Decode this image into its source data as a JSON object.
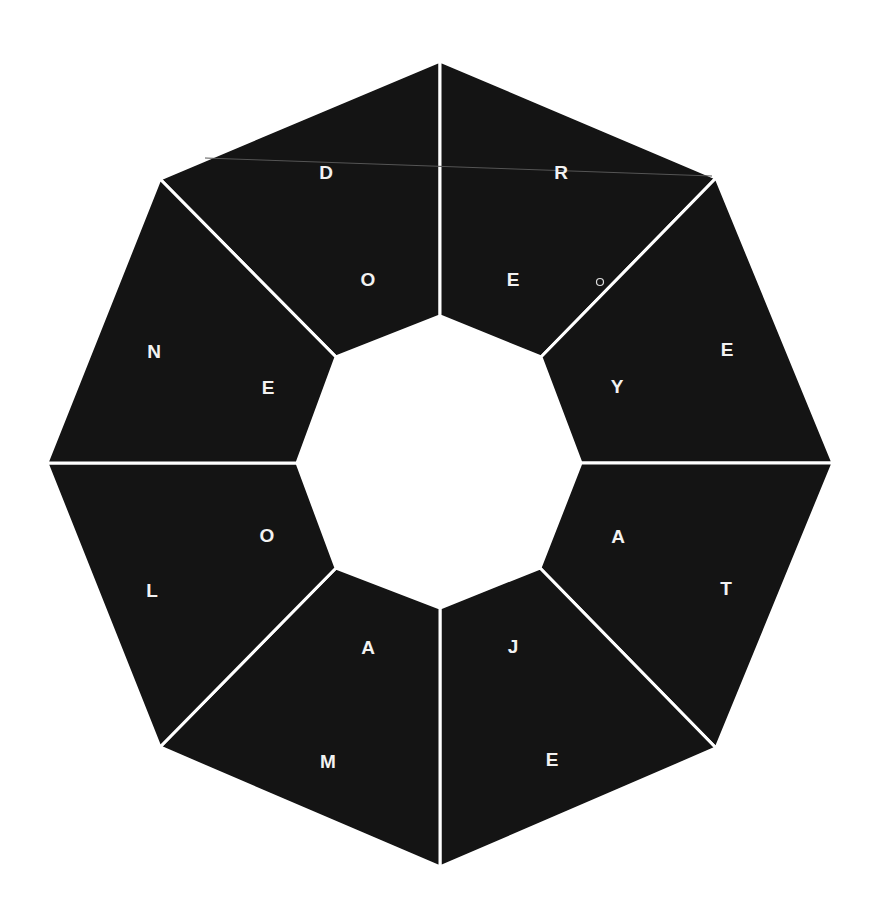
{
  "diagram": {
    "type": "octagonal-ring-word-puzzle",
    "colors": {
      "segment_fill": "#141414",
      "divider": "#ffffff",
      "letters": "#f2f2f2",
      "background": "#ffffff"
    },
    "segments": [
      {
        "position": "top-left",
        "outer_letter": "D",
        "inner_letter": "O"
      },
      {
        "position": "top-right",
        "outer_letter": "R",
        "inner_letter": "E"
      },
      {
        "position": "right-upper",
        "outer_letter": "E",
        "inner_letter": "Y"
      },
      {
        "position": "right-lower",
        "outer_letter": "T",
        "inner_letter": "A"
      },
      {
        "position": "bottom-right",
        "outer_letter": "E",
        "inner_letter": "J"
      },
      {
        "position": "bottom-left",
        "outer_letter": "M",
        "inner_letter": "A"
      },
      {
        "position": "left-lower",
        "outer_letter": "L",
        "inner_letter": "O"
      },
      {
        "position": "left-upper",
        "outer_letter": "N",
        "inner_letter": "E"
      }
    ]
  }
}
